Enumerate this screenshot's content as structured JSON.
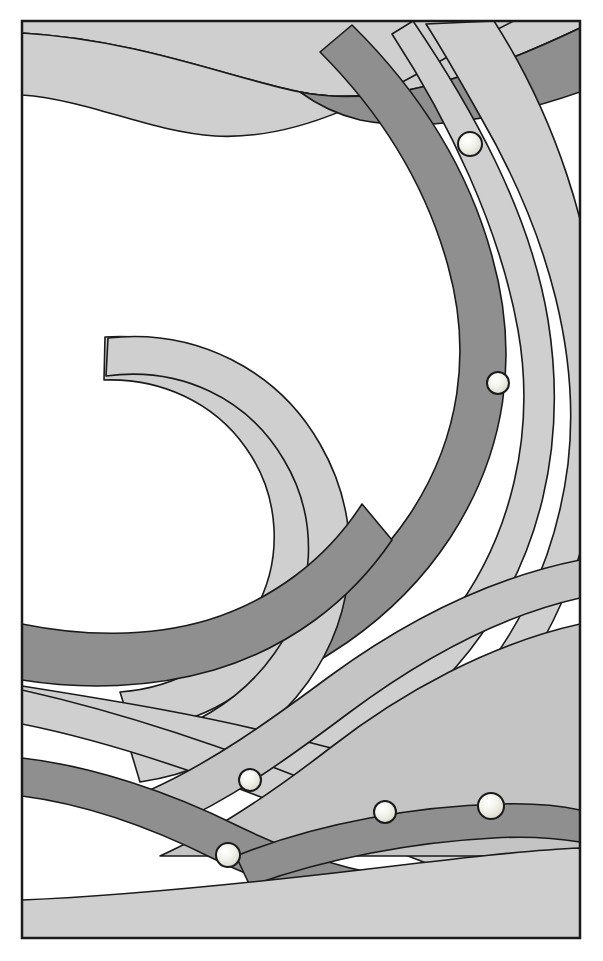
{
  "artwork": {
    "title": "Abstract Flowing Ribbons with Spheres",
    "width": 603,
    "height": 961,
    "background_color": "#ffffff",
    "frame": {
      "x": 22,
      "y": 21,
      "width": 558,
      "height": 917,
      "stroke_color": "#1a1a1a",
      "stroke_width": 2.5,
      "fill": "none"
    },
    "palette": {
      "white": "#ffffff",
      "near_white": "#f2f2f2",
      "light_gray": "#cfcfcf",
      "mid_gray": "#c4c4c4",
      "dark_gray": "#8f8f8f",
      "outline": "#1a1a1a",
      "sphere_light": "#f7f7f2",
      "sphere_shade": "#d8d8cf"
    },
    "stroke_width": 1.6,
    "ribbons": [
      {
        "id": "ribbon-top-light-1",
        "tone": "light_gray",
        "path": "M 22 33 C 140 40 230 78 300 92 C 380 108 470 80 580 28 L 580 21 L 22 21 Z"
      },
      {
        "id": "ribbon-top-light-2",
        "tone": "light_gray",
        "path": "M 22 95 C 90 100 150 132 215 136 C 300 141 380 96 470 44 C 520 16 555 2 580 -6 L 580 28 C 470 80 380 108 300 92 C 230 78 140 40 22 33 Z"
      },
      {
        "id": "ribbon-top-dark-wedge",
        "tone": "dark_gray",
        "path": "M 300 92 C 380 108 470 80 580 28 L 580 92 C 500 120 420 132 360 120 C 335 114 315 103 300 92 Z"
      },
      {
        "id": "ribbon-big-arc-outer-light",
        "tone": "light_gray",
        "path": "M 413 21 C 470 105 530 210 548 320 C 568 445 540 560 470 650 C 420 714 352 760 280 790 L 268 752 C 340 724 404 678 450 618 C 512 538 536 432 518 330 C 500 228 448 120 392 34 Z"
      },
      {
        "id": "ribbon-big-arc-mid-light",
        "tone": "light_gray",
        "path": "M 494 21 C 556 118 592 232 598 330 L 598 470 C 584 580 536 672 466 742 C 410 798 340 836 268 858 L 258 818 C 330 798 396 762 448 712 C 514 648 556 560 568 464 C 580 360 552 240 480 116 C 462 84 444 52 426 24 Z"
      },
      {
        "id": "ribbon-big-arc-dark",
        "tone": "dark_gray",
        "path": "M 352 25 C 420 92 468 168 492 256 C 520 356 506 452 450 538 C 396 620 310 678 212 706 L 196 664 C 286 638 362 586 410 514 C 460 438 472 352 448 266 C 426 186 382 114 320 52 Z"
      },
      {
        "id": "ribbon-inner-circle-light-1",
        "tone": "light_gray",
        "path": "M 105 337 C 180 332 248 366 288 424 C 330 486 334 566 296 632 C 262 690 200 726 132 730 L 120 692 C 176 688 226 660 254 612 C 284 560 280 496 246 448 C 214 402 160 378 104 380 Z"
      },
      {
        "id": "ribbon-inner-circle-light-2",
        "tone": "light_gray",
        "path": "M 108 338 C 196 328 278 370 320 444 C 364 520 358 612 308 682 C 268 738 208 772 140 782 L 128 742 C 188 732 240 702 274 654 C 316 596 320 520 284 460 C 248 398 180 366 106 376 Z"
      },
      {
        "id": "ribbon-inner-circle-dark",
        "tone": "dark_gray",
        "path": "M 22 624 C 80 636 148 638 208 620 C 272 600 326 560 362 504 L 392 540 C 350 602 288 648 214 670 C 152 688 84 690 22 680 Z"
      },
      {
        "id": "ribbon-mid-sweep-light",
        "tone": "light_gray",
        "path": "M 22 686 C 110 700 210 716 300 740 C 400 766 500 790 580 806 L 580 846 C 496 830 392 806 290 778 C 196 752 100 732 22 720 Z"
      },
      {
        "id": "ribbon-mid-sweep-light-2",
        "tone": "light_gray",
        "path": "M 22 690 C 120 712 230 748 330 790 C 430 830 510 862 580 880 L 580 912 C 500 894 416 860 314 818 C 216 778 112 742 22 724 Z"
      },
      {
        "id": "ribbon-lower-right-band",
        "tone": "mid_gray",
        "path": "M 580 598 C 500 616 420 660 350 712 C 286 760 230 800 170 826 L 150 790 C 212 762 268 722 330 676 C 404 622 490 578 580 560 Z"
      },
      {
        "id": "ribbon-right-wide-fill",
        "tone": "mid_gray",
        "path": "M 580 624 C 490 644 402 692 330 748 C 268 796 214 832 160 856 L 580 856 Z"
      },
      {
        "id": "ribbon-bottom-left-dark",
        "tone": "dark_gray",
        "path": "M 22 758 C 92 766 170 792 238 826 C 300 856 356 874 420 880 L 420 918 C 344 912 278 890 212 858 C 148 826 84 804 22 796 Z"
      },
      {
        "id": "ribbon-bottom-band-dark",
        "tone": "dark_gray",
        "path": "M 236 856 C 320 822 420 806 500 804 C 536 803 562 806 580 810 L 580 842 C 556 838 526 836 494 838 C 416 842 326 858 250 886 Z"
      },
      {
        "id": "ribbon-bottom-fill-light",
        "tone": "light_gray",
        "path": "M 22 900 C 120 896 240 884 360 870 C 460 858 530 850 580 848 L 580 938 L 22 938 Z"
      }
    ],
    "spheres": [
      {
        "id": "sphere-1",
        "cx": 470,
        "cy": 144,
        "r": 12
      },
      {
        "id": "sphere-2",
        "cx": 498,
        "cy": 383,
        "r": 11
      },
      {
        "id": "sphere-3",
        "cx": 250,
        "cy": 780,
        "r": 11
      },
      {
        "id": "sphere-4",
        "cx": 385,
        "cy": 812,
        "r": 11
      },
      {
        "id": "sphere-5",
        "cx": 491,
        "cy": 806,
        "r": 13
      },
      {
        "id": "sphere-6",
        "cx": 228,
        "cy": 855,
        "r": 12
      }
    ]
  }
}
